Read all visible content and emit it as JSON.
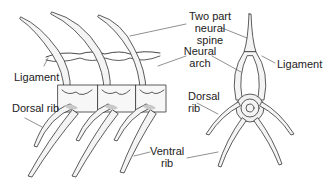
{
  "figure": {
    "lateral_view_labels": {
      "ligament": "Ligament",
      "dorsal_rib": "Dorsal rib"
    },
    "center_labels": {
      "neural_spine_line1": "Two part",
      "neural_spine_line2": "neural",
      "neural_spine_line3": "spine",
      "neural_arch_line1": "Neural",
      "neural_arch_line2": "arch",
      "dorsal_rib_line1": "Dorsal",
      "dorsal_rib_line2": "rib",
      "ventral_rib_line1": "Ventral",
      "ventral_rib_line2": "rib"
    },
    "cross_section_labels": {
      "ligament": "Ligament"
    },
    "colors": {
      "line": "#333333",
      "bone_fill": "#f4f4f4",
      "shade": "#c8c8c8"
    }
  }
}
